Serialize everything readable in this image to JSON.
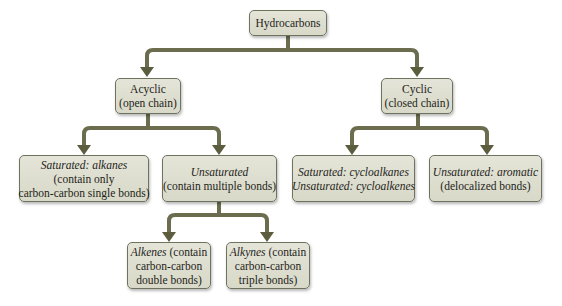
{
  "diagram": {
    "title": "Hydrocarbons",
    "connector_color": "#6b6d4e",
    "box_fill": "#dcddcd",
    "box_border": "#6e7360",
    "nodes": {
      "root": {
        "lines": [
          "Hydrocarbons"
        ]
      },
      "acyclic": {
        "lines": [
          "Acyclic",
          "(open chain)"
        ]
      },
      "cyclic": {
        "lines": [
          "Cyclic",
          "(closed chain)"
        ]
      },
      "saturated_alkanes": {
        "italic": "Saturated: alkanes",
        "lines": [
          "(contain only",
          "carbon-carbon single bonds)"
        ]
      },
      "unsaturated": {
        "italic": "Unsaturated",
        "lines": [
          "(contain multiple bonds)"
        ]
      },
      "cyclo": {
        "italic_lines": [
          "Saturated: cycloalkanes",
          "Unsaturated: cycloalkenes"
        ]
      },
      "aromatic": {
        "italic": "Unsaturated: aromatic",
        "lines": [
          "(delocalized bonds)"
        ]
      },
      "alkenes": {
        "italic": "Alkenes",
        "rest": " (contain",
        "lines": [
          "carbon-carbon",
          "double bonds)"
        ]
      },
      "alkynes": {
        "italic": "Alkynes",
        "rest": " (contain",
        "lines": [
          "carbon-carbon",
          "triple bonds)"
        ]
      }
    },
    "edges": [
      [
        "root",
        "acyclic"
      ],
      [
        "root",
        "cyclic"
      ],
      [
        "acyclic",
        "saturated_alkanes"
      ],
      [
        "acyclic",
        "unsaturated"
      ],
      [
        "cyclic",
        "cyclo"
      ],
      [
        "cyclic",
        "aromatic"
      ],
      [
        "unsaturated",
        "alkenes"
      ],
      [
        "unsaturated",
        "alkynes"
      ]
    ]
  }
}
